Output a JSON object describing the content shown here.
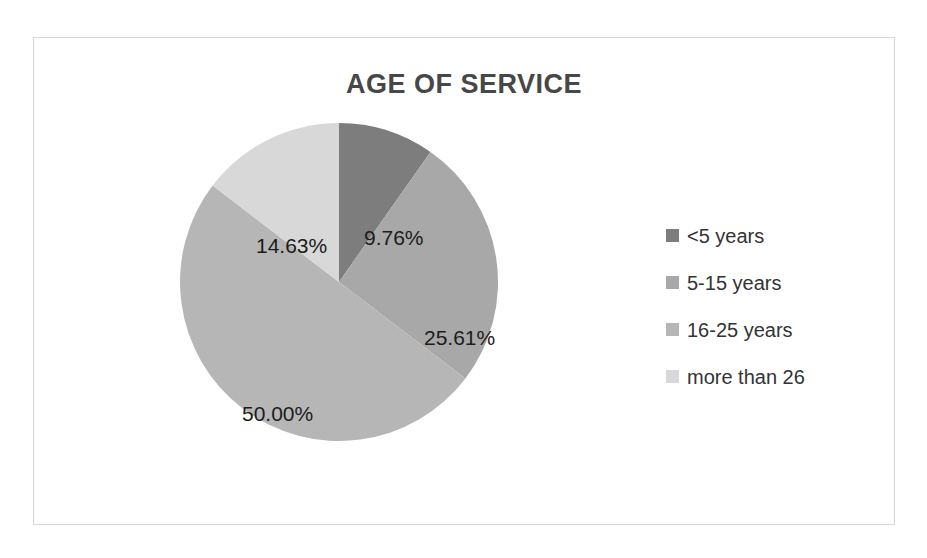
{
  "chart_data": {
    "type": "pie",
    "title": "AGE OF SERVICE",
    "categories": [
      "<5 years",
      "5-15 years",
      "16-25 years",
      "more than 26"
    ],
    "values": [
      9.76,
      25.61,
      50.0,
      14.63
    ],
    "value_labels": [
      "9.76%",
      "25.61%",
      "50.00%",
      "14.63%"
    ],
    "unit": "%",
    "start_angle_deg": 0,
    "direction": "clockwise",
    "legend_position": "right",
    "grid": false,
    "xlabel": "",
    "ylabel": "",
    "colors": [
      "#7d7d7d",
      "#a8a8a8",
      "#b6b6b6",
      "#d8d8d8"
    ],
    "title_color": "#474747",
    "label_color": "#1c1c1c",
    "legend_text_color": "#333333",
    "frame_color": "#d6d6d6",
    "background": "#ffffff"
  }
}
